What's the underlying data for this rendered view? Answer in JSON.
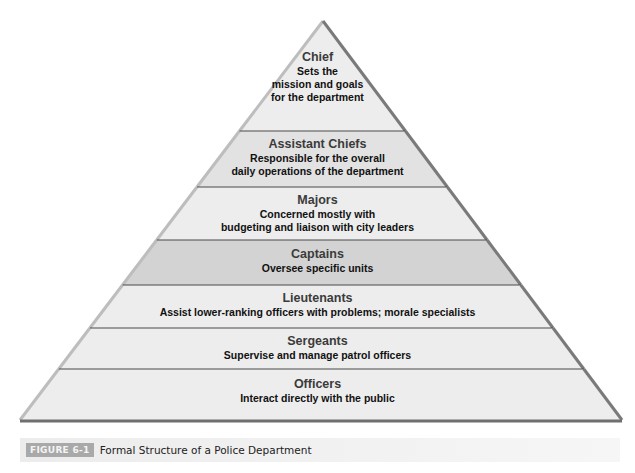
{
  "figure": {
    "label": "FIGURE 6-1",
    "title": "Formal Structure of a Police Department"
  },
  "levels": [
    {
      "title": "Chief",
      "description": "Sets the\nmission and goals\nfor the department",
      "shade": "light"
    },
    {
      "title": "Assistant Chiefs",
      "description": "Responsible for the overall\ndaily operations of the department",
      "shade": "medium"
    },
    {
      "title": "Majors",
      "description": "Concerned mostly with\nbudgeting and liaison with city leaders",
      "shade": "light"
    },
    {
      "title": "Captains",
      "description": "Oversee specific units",
      "shade": "dark"
    },
    {
      "title": "Lieutenants",
      "description": "Assist lower-ranking officers with problems; morale specialists",
      "shade": "light"
    },
    {
      "title": "Sergeants",
      "description": "Supervise and manage patrol officers",
      "shade": "light"
    },
    {
      "title": "Officers",
      "description": "Interact directly with the public",
      "shade": "light"
    }
  ],
  "colors": {
    "light": "#ededed",
    "medium": "#e2e2e2",
    "dark": "#d3d3d3",
    "divider": "#4a4a4a",
    "edge": "#8a8a8a"
  }
}
